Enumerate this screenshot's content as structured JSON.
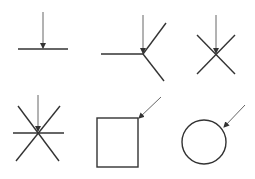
{
  "canvas": {
    "width": 255,
    "height": 179,
    "background": "#ffffff"
  },
  "colors": {
    "stroke": "#333333",
    "arrow": "#666666"
  },
  "figures": [
    {
      "name": "line-end-point",
      "arrow": {
        "x1": 43,
        "y1": 12,
        "x2": 43,
        "y2": 48
      },
      "lines": [
        {
          "x1": 18,
          "y1": 49,
          "x2": 68,
          "y2": 49
        }
      ]
    },
    {
      "name": "three-way-junction",
      "arrow": {
        "x1": 143,
        "y1": 15,
        "x2": 143,
        "y2": 53
      },
      "lines": [
        {
          "x1": 101,
          "y1": 54,
          "x2": 143,
          "y2": 54
        },
        {
          "x1": 143,
          "y1": 54,
          "x2": 166,
          "y2": 23
        },
        {
          "x1": 143,
          "y1": 54,
          "x2": 164,
          "y2": 81
        }
      ]
    },
    {
      "name": "x-crossing",
      "arrow": {
        "x1": 216,
        "y1": 15,
        "x2": 216,
        "y2": 53
      },
      "lines": [
        {
          "x1": 197,
          "y1": 35,
          "x2": 235,
          "y2": 74
        },
        {
          "x1": 235,
          "y1": 35,
          "x2": 197,
          "y2": 74
        }
      ]
    },
    {
      "name": "six-way-star",
      "arrow": {
        "x1": 38,
        "y1": 95,
        "x2": 38,
        "y2": 131
      },
      "lines": [
        {
          "x1": 13,
          "y1": 133,
          "x2": 64,
          "y2": 133
        },
        {
          "x1": 18,
          "y1": 106,
          "x2": 59,
          "y2": 161
        },
        {
          "x1": 60,
          "y1": 106,
          "x2": 16,
          "y2": 161
        }
      ]
    },
    {
      "name": "square-corner",
      "arrow": {
        "x1": 161,
        "y1": 97,
        "x2": 139,
        "y2": 118
      },
      "rect": {
        "x": 97,
        "y": 118,
        "width": 41,
        "height": 49
      }
    },
    {
      "name": "circle-edge",
      "arrow": {
        "x1": 245,
        "y1": 105,
        "x2": 224,
        "y2": 127
      },
      "circle": {
        "cx": 204,
        "cy": 142,
        "r": 22
      }
    }
  ]
}
